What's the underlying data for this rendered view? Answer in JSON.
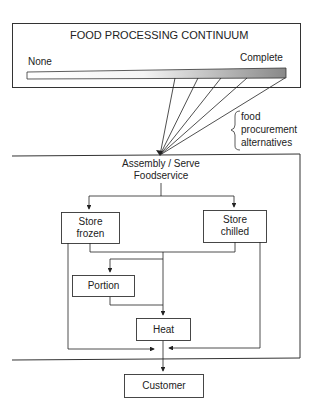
{
  "continuum": {
    "title": "FOOD PROCESSING CONTINUUM",
    "left_label": "None",
    "right_label": "Complete"
  },
  "brace": {
    "line1": "food",
    "line2": "procurement",
    "line3": "alternatives"
  },
  "system": {
    "title_line1": "Assembly / Serve",
    "title_line2": "Foodservice"
  },
  "nodes": {
    "store_frozen": {
      "line1": "Store",
      "line2": "frozen"
    },
    "store_chilled": {
      "line1": "Store",
      "line2": "chilled"
    },
    "portion": "Portion",
    "heat": "Heat",
    "customer": "Customer"
  },
  "colors": {
    "line": "#222222",
    "bar_light": "#ffffff",
    "bar_dark": "#8a8a8a"
  }
}
